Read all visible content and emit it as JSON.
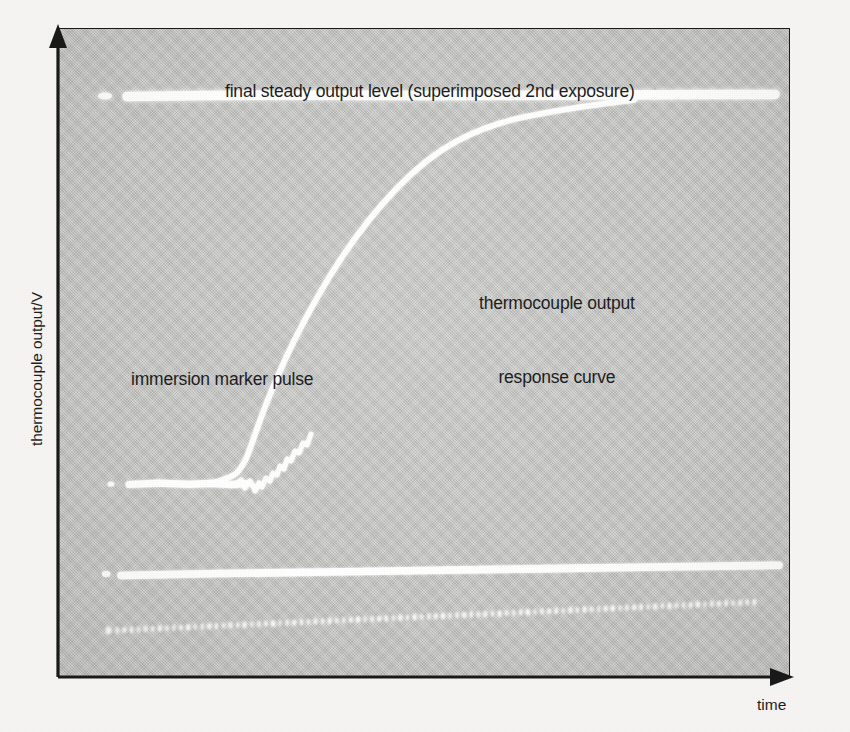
{
  "figure": {
    "background_color": "#f6f5f3",
    "plot_background_color": "#c9c9c7",
    "trace_color": "#ffffff",
    "axis_color": "#1a1a1a",
    "text_color": "#1e1e1e"
  },
  "axes": {
    "y_label": "thermocouple output/V",
    "x_label": "time",
    "y_arrow": "up-arrow",
    "x_arrow": "right-arrow"
  },
  "annotations": {
    "final_level": "final steady output level (superimposed 2nd exposure)",
    "response_curve_line1": "thermocouple output",
    "response_curve_line2": "response curve",
    "immersion_marker": "immersion marker pulse",
    "timing_pulses": "timing pulses on marked trace"
  },
  "chart_data": {
    "type": "line",
    "title": "",
    "xlabel": "time",
    "ylabel": "thermocouple output/V",
    "xlim": [
      0,
      100
    ],
    "ylim": [
      0,
      100
    ],
    "grid": false,
    "legend": "none",
    "series": [
      {
        "name": "final steady output level (superimposed 2nd exposure)",
        "style": "thick-solid-white",
        "comment": "horizontal saturated trace near top of frame",
        "x": [
          5.8,
          10,
          20,
          30,
          40,
          50,
          60,
          70,
          80,
          90,
          98
        ],
        "y": [
          89.6,
          89.7,
          89.7,
          89.8,
          89.8,
          89.9,
          89.9,
          90.0,
          90.0,
          90.1,
          90.1
        ]
      },
      {
        "name": "thermocouple output response curve",
        "style": "thin-solid-white",
        "comment": "exponential first-order step response rising from baseline to steady level",
        "x": [
          9.6,
          17,
          24,
          27,
          28.5,
          30,
          32,
          35,
          38,
          42,
          46,
          50,
          55,
          60,
          65,
          70,
          76,
          82,
          90,
          98
        ],
        "y": [
          30.0,
          30.2,
          30.6,
          31.8,
          33.5,
          36.0,
          41.0,
          48.5,
          55.5,
          63.5,
          70.0,
          75.3,
          80.6,
          84.2,
          86.6,
          88.2,
          89.3,
          89.7,
          89.9,
          90.0
        ]
      },
      {
        "name": "immersion marker pulse",
        "style": "thick-solid-white-segment",
        "comment": "short flat baseline segment before immersion, ends at the step onset",
        "x": [
          7.1,
          9.6,
          14,
          18,
          22,
          26
        ],
        "y": [
          30.0,
          30.0,
          30.1,
          30.0,
          30.1,
          30.2
        ]
      },
      {
        "name": "marked trace baseline",
        "style": "thick-solid-white",
        "comment": "second horizontal trace lower in frame, slight upward slope",
        "x": [
          6.3,
          15,
          30,
          45,
          60,
          75,
          90,
          98
        ],
        "y": [
          16.0,
          16.3,
          16.7,
          17.1,
          17.5,
          17.9,
          18.3,
          18.6
        ]
      },
      {
        "name": "timing pulses on marked trace",
        "style": "dotted-white",
        "comment": "evenly spaced timing dots below the marked trace, slight upward slope",
        "x": [
          7,
          11,
          15,
          19,
          23,
          27,
          31,
          35,
          39,
          43,
          47,
          51,
          55,
          59,
          63,
          67,
          71,
          75,
          79,
          83,
          87,
          91,
          95
        ],
        "y": [
          7.3,
          7.5,
          7.7,
          7.9,
          8.1,
          8.3,
          8.5,
          8.7,
          8.9,
          9.1,
          9.3,
          9.5,
          9.7,
          9.9,
          10.1,
          10.3,
          10.5,
          10.7,
          10.9,
          11.1,
          11.3,
          11.5,
          11.7
        ]
      }
    ]
  }
}
